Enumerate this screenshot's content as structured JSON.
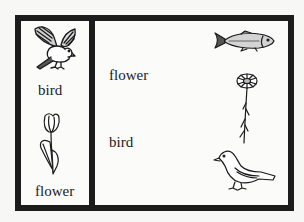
{
  "worksheet": {
    "left_panel": {
      "items": [
        {
          "icon": "flying-bird-icon",
          "label": "bird"
        },
        {
          "icon": "tulip-icon",
          "label": "flower"
        }
      ]
    },
    "right_panel": {
      "words": [
        {
          "text": "flower"
        },
        {
          "text": "bird"
        }
      ],
      "pictures": [
        {
          "icon": "fish-icon"
        },
        {
          "icon": "daisy-icon"
        },
        {
          "icon": "songbird-icon"
        }
      ]
    },
    "colors": {
      "frame": "#1c1c1c",
      "paper": "#fbfbfa",
      "ink": "#1a1a1a"
    }
  }
}
